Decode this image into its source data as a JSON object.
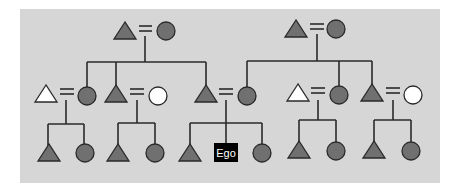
{
  "colors": {
    "background": "#d6d6d6",
    "filled": "#707070",
    "empty": "#ffffff",
    "stroke": "#2a2a2a",
    "ego_box": "#000000",
    "ego_text": "#ffffff"
  },
  "ego_label": "Ego",
  "legend": {
    "triangle": "male",
    "circle": "female",
    "equals": "marriage",
    "line": "descent"
  }
}
